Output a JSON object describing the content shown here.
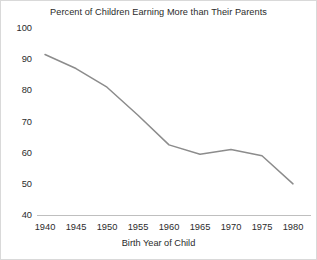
{
  "chart_data": {
    "type": "line",
    "title": "Percent of Children Earning More than Their Parents",
    "xlabel": "Birth Year of Child",
    "ylabel": "",
    "x": [
      1940,
      1945,
      1950,
      1955,
      1960,
      1965,
      1970,
      1975,
      1980
    ],
    "values": [
      91.5,
      87,
      81,
      72,
      62.5,
      59.5,
      61,
      59,
      50
    ],
    "series": [
      {
        "name": "Percent of children earning more than their parents",
        "values": [
          91.5,
          87,
          81,
          72,
          62.5,
          59.5,
          61,
          59,
          50
        ]
      }
    ],
    "xlim": [
      1940,
      1980
    ],
    "ylim": [
      40,
      100
    ],
    "xticks": [
      "1940",
      "1945",
      "1950",
      "1955",
      "1960",
      "1965",
      "1970",
      "1975",
      "1980"
    ],
    "yticks": [
      "40",
      "50",
      "60",
      "70",
      "80",
      "90",
      "100"
    ],
    "grid": false,
    "legend": "none",
    "line_color": "#8c8c8c",
    "text_color": "#2b2b2b",
    "axis_color": "#bfbfbf",
    "background": "#ffffff"
  }
}
